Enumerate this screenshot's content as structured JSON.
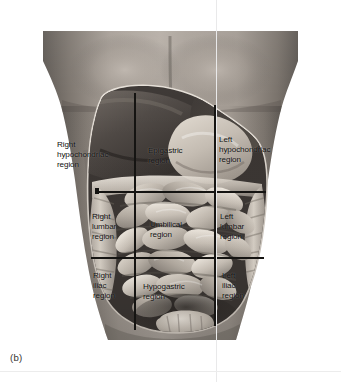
{
  "figure": {
    "caption": "(b)",
    "title_hidden": "",
    "colors": {
      "background": "#ffffff",
      "skin_light": "#b4aca6",
      "skin_mid": "#8e8781",
      "skin_dark": "#6d6762",
      "skin_shadow": "#55504c",
      "cavity_rim": "#cdc6bf",
      "liver_dark": "#4a4541",
      "stomach_light": "#c8c1b8",
      "intestine_light": "#cac3ba",
      "intestine_mid": "#a39b92",
      "grid_line": "#151412",
      "label_text": "#100f0e"
    }
  },
  "grid": {
    "vertical_lines": [
      135,
      215
    ],
    "horizontal_lines": [
      192,
      258
    ],
    "columns": [
      "right",
      "middle",
      "left"
    ],
    "rows": [
      "upper",
      "middle",
      "lower"
    ]
  },
  "regions": [
    {
      "id": "right-hypochondriac",
      "lines": [
        "Right",
        "hypochondriac",
        "region"
      ],
      "x": 57,
      "y": 140,
      "row": "upper",
      "column": "right"
    },
    {
      "id": "epigastric",
      "lines": [
        "Epigastric",
        "region"
      ],
      "x": 148,
      "y": 146,
      "row": "upper",
      "column": "middle"
    },
    {
      "id": "left-hypochondriac",
      "lines": [
        "Left",
        "hypochondriac",
        "region"
      ],
      "x": 219,
      "y": 135,
      "row": "upper",
      "column": "left"
    },
    {
      "id": "right-lumbar",
      "lines": [
        "Right",
        "lumbar",
        "region"
      ],
      "x": 92,
      "y": 212,
      "row": "middle",
      "column": "right"
    },
    {
      "id": "umbilical",
      "lines": [
        "Umbilical",
        "region"
      ],
      "x": 150,
      "y": 220,
      "row": "middle",
      "column": "middle"
    },
    {
      "id": "left-lumbar",
      "lines": [
        "Left",
        "lumbar",
        "region"
      ],
      "x": 220,
      "y": 212,
      "row": "middle",
      "column": "left"
    },
    {
      "id": "right-iliac",
      "lines": [
        "Right",
        "iliac",
        "region"
      ],
      "x": 93,
      "y": 271,
      "row": "lower",
      "column": "right"
    },
    {
      "id": "hypogastric",
      "lines": [
        "Hypogastric",
        "region"
      ],
      "x": 143,
      "y": 282,
      "row": "lower",
      "column": "middle"
    },
    {
      "id": "left-iliac",
      "lines": [
        "Left",
        "iliac",
        "region"
      ],
      "x": 222,
      "y": 271,
      "row": "lower",
      "column": "left"
    }
  ],
  "artifacts": {
    "vertical_scanline_x": 216,
    "horizontal_scanline_y": 371
  }
}
